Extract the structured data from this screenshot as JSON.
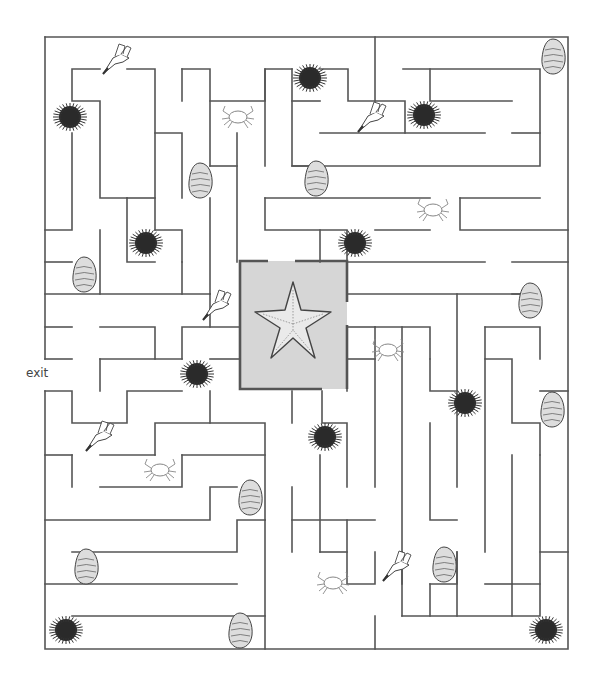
{
  "puzzle": {
    "type": "maze",
    "exit_label": "exit",
    "center_goal": "starfish",
    "center_box_color": "#d6d6d6",
    "wall_color": "#555555"
  },
  "creatures": [
    {
      "kind": "seagull",
      "x": 117,
      "y": 60
    },
    {
      "kind": "urchin",
      "x": 70,
      "y": 117
    },
    {
      "kind": "crab",
      "x": 238,
      "y": 117
    },
    {
      "kind": "urchin",
      "x": 310,
      "y": 78
    },
    {
      "kind": "seagull",
      "x": 372,
      "y": 118
    },
    {
      "kind": "urchin",
      "x": 424,
      "y": 115
    },
    {
      "kind": "oyster",
      "x": 553,
      "y": 56
    },
    {
      "kind": "oyster",
      "x": 200,
      "y": 180
    },
    {
      "kind": "oyster",
      "x": 316,
      "y": 178
    },
    {
      "kind": "crab",
      "x": 433,
      "y": 210
    },
    {
      "kind": "urchin",
      "x": 146,
      "y": 243
    },
    {
      "kind": "urchin",
      "x": 355,
      "y": 243
    },
    {
      "kind": "oyster",
      "x": 84,
      "y": 274
    },
    {
      "kind": "oyster",
      "x": 530,
      "y": 300
    },
    {
      "kind": "seagull",
      "x": 217,
      "y": 306
    },
    {
      "kind": "crab",
      "x": 388,
      "y": 350
    },
    {
      "kind": "urchin",
      "x": 197,
      "y": 374
    },
    {
      "kind": "urchin",
      "x": 465,
      "y": 403
    },
    {
      "kind": "oyster",
      "x": 552,
      "y": 409
    },
    {
      "kind": "seagull",
      "x": 100,
      "y": 437
    },
    {
      "kind": "urchin",
      "x": 325,
      "y": 437
    },
    {
      "kind": "crab",
      "x": 160,
      "y": 470
    },
    {
      "kind": "oyster",
      "x": 250,
      "y": 497
    },
    {
      "kind": "oyster",
      "x": 86,
      "y": 566
    },
    {
      "kind": "seagull",
      "x": 397,
      "y": 567
    },
    {
      "kind": "oyster",
      "x": 444,
      "y": 564
    },
    {
      "kind": "crab",
      "x": 333,
      "y": 583
    },
    {
      "kind": "urchin",
      "x": 66,
      "y": 630
    },
    {
      "kind": "oyster",
      "x": 240,
      "y": 630
    },
    {
      "kind": "urchin",
      "x": 546,
      "y": 630
    }
  ]
}
